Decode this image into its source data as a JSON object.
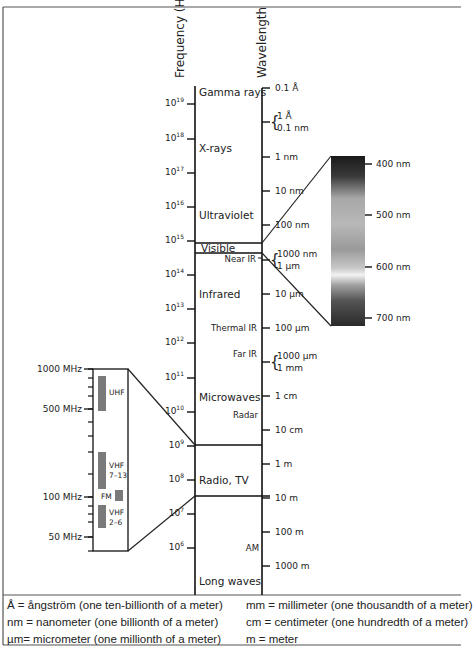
{
  "title_axes": {
    "frequency_label": "Frequency (Hz)",
    "wavelength_label": "Wavelength"
  },
  "frequency_ticks": [
    {
      "base": "10",
      "exp": "19",
      "y": 104
    },
    {
      "base": "10",
      "exp": "18",
      "y": 139
    },
    {
      "base": "10",
      "exp": "17",
      "y": 173
    },
    {
      "base": "10",
      "exp": "16",
      "y": 207
    },
    {
      "base": "10",
      "exp": "15",
      "y": 241
    },
    {
      "base": "10",
      "exp": "14",
      "y": 275
    },
    {
      "base": "10",
      "exp": "13",
      "y": 309
    },
    {
      "base": "10",
      "exp": "12",
      "y": 343
    },
    {
      "base": "10",
      "exp": "11",
      "y": 378
    },
    {
      "base": "10",
      "exp": "10",
      "y": 412
    },
    {
      "base": "10",
      "exp": "9",
      "y": 446
    },
    {
      "base": "10",
      "exp": "8",
      "y": 480
    },
    {
      "base": "10",
      "exp": "7",
      "y": 514
    },
    {
      "base": "10",
      "exp": "6",
      "y": 548
    }
  ],
  "wavelength_ticks": [
    {
      "label": "0.1 Å",
      "y": 88
    },
    {
      "label": "1 Å",
      "label2": "0.1 nm",
      "y": 122,
      "brace": true
    },
    {
      "label": "1 nm",
      "y": 157
    },
    {
      "label": "10 nm",
      "y": 191
    },
    {
      "label": "100 nm",
      "y": 225
    },
    {
      "label": "1000 nm",
      "label2": "1 µm",
      "y": 260,
      "brace": true
    },
    {
      "label": "10 µm",
      "y": 294
    },
    {
      "label": "100 µm",
      "y": 328
    },
    {
      "label": "1000 µm",
      "label2": "1 mm",
      "y": 362,
      "brace": true
    },
    {
      "label": "1 cm",
      "y": 396
    },
    {
      "label": "10 cm",
      "y": 430
    },
    {
      "label": "1 m",
      "y": 464
    },
    {
      "label": "10 m",
      "y": 498
    },
    {
      "label": "100 m",
      "y": 532
    },
    {
      "label": "1000 m",
      "y": 566
    }
  ],
  "bands": [
    {
      "label": "Gamma rays",
      "x": 199,
      "y": 96
    },
    {
      "label": "X-rays",
      "x": 199,
      "y": 152
    },
    {
      "label": "Ultraviolet",
      "x": 199,
      "y": 219
    },
    {
      "label": "Visible",
      "x": 201,
      "y": 252
    },
    {
      "label": "Infrared",
      "x": 199,
      "y": 298
    },
    {
      "label": "Microwaves",
      "x": 199,
      "y": 401
    },
    {
      "label": "Radio, TV",
      "x": 199,
      "y": 484
    },
    {
      "label": "Long waves",
      "x": 199,
      "y": 585
    }
  ],
  "sub_bands": [
    {
      "label": "Near IR",
      "x": 256,
      "y": 262
    },
    {
      "label": "Thermal IR",
      "x": 257,
      "y": 331
    },
    {
      "label": "Far IR",
      "x": 257,
      "y": 357
    },
    {
      "label": "Radar",
      "x": 258,
      "y": 418
    },
    {
      "label": "AM",
      "x": 259,
      "y": 551
    }
  ],
  "visible_spectrum": {
    "ticks": [
      {
        "label": "400 nm",
        "y": 164
      },
      {
        "label": "500 nm",
        "y": 215
      },
      {
        "label": "600 nm",
        "y": 267
      },
      {
        "label": "700 nm",
        "y": 318
      }
    ]
  },
  "radio_inset": {
    "ticks": [
      {
        "label": "1000 MHz",
        "y": 369
      },
      {
        "label": "500 MHz",
        "y": 409
      },
      {
        "label": "100 MHz",
        "y": 497
      },
      {
        "label": "50 MHz",
        "y": 537
      }
    ],
    "bands": [
      {
        "label": "UHF",
        "label2": "",
        "x": 98,
        "y1": 376,
        "y2": 411,
        "lx": 109,
        "ly": 395
      },
      {
        "label": "VHF",
        "label2": "7–13",
        "x": 98,
        "y1": 452,
        "y2": 489,
        "lx": 109,
        "ly": 468
      },
      {
        "label": "FM",
        "label2": "",
        "x": 115,
        "y1": 490,
        "y2": 501,
        "lx": 101,
        "ly": 499
      },
      {
        "label": "VHF",
        "label2": "2–6",
        "x": 98,
        "y1": 505,
        "y2": 528,
        "lx": 109,
        "ly": 515
      }
    ]
  },
  "legend": {
    "left": [
      "Å = ångström (one ten-billionth of a meter)",
      "nm = nanometer (one billionth of a meter)",
      "µm= micrometer (one millionth of a meter)"
    ],
    "right": [
      "mm = millimeter (one thousandth of a meter)",
      "cm  = centimeter (one hundredth of a meter)",
      "m = meter"
    ]
  }
}
